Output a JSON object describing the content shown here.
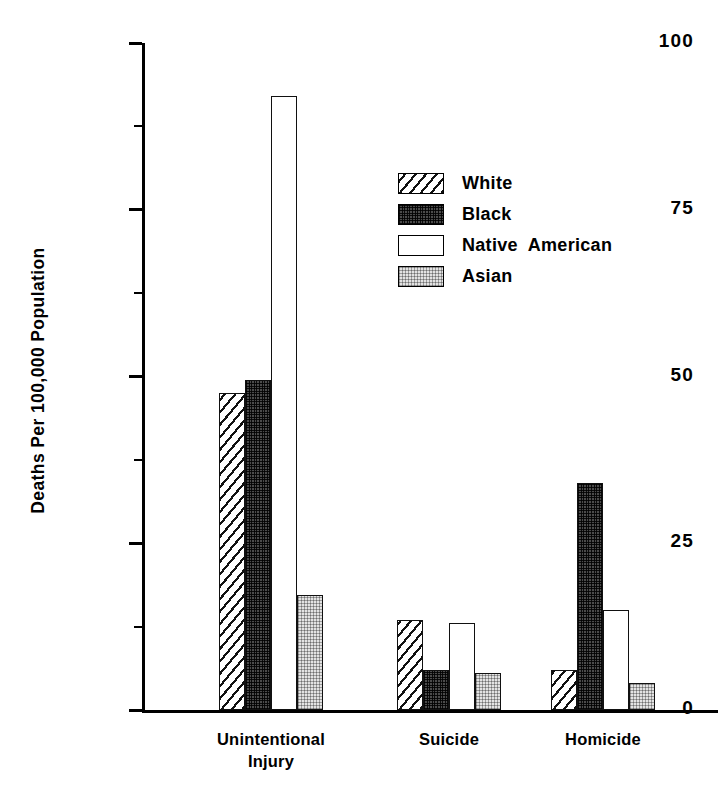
{
  "chart_data": {
    "type": "bar",
    "title": "",
    "xlabel": "",
    "ylabel": "Deaths Per 100,000 Population",
    "categories": [
      "Unintentional\nInjury",
      "Suicide",
      "Homicide"
    ],
    "series": [
      {
        "name": "White",
        "pattern": "diagonal-hatch",
        "values": [
          47.5,
          13.5,
          6.0
        ]
      },
      {
        "name": "Black",
        "pattern": "dark-stipple",
        "values": [
          49.5,
          6.0,
          34.0
        ]
      },
      {
        "name": "Native  American",
        "pattern": "empty-white",
        "values": [
          92.0,
          13.0,
          15.0
        ]
      },
      {
        "name": "Asian",
        "pattern": "light-stipple",
        "values": [
          17.2,
          5.5,
          4.0
        ]
      }
    ],
    "ylim": [
      0,
      100
    ],
    "yticks": [
      0,
      25,
      50,
      75,
      100
    ],
    "ytick_labels": [
      "0",
      "25",
      "50",
      "75",
      "100"
    ],
    "yminor_ticks": [
      12.5,
      37.5,
      62.5,
      87.5
    ],
    "grid": false,
    "legend_position": "upper-right"
  },
  "legend": {
    "entries": [
      {
        "label": "White"
      },
      {
        "label": "Black"
      },
      {
        "label": "Native  American"
      },
      {
        "label": "Asian"
      }
    ]
  },
  "colors": {
    "axis": "#000000",
    "bar_outline": "#111111",
    "white_fill": "#fdfdfd",
    "black_fill": "#4b4b4b",
    "native_fill": "#ffffff",
    "asian_fill": "#e3e3e3",
    "background": "#ffffff"
  }
}
